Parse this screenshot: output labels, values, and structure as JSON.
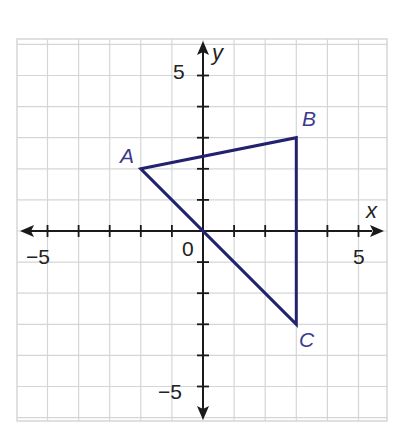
{
  "diagram": {
    "type": "coordinate-plane",
    "axes": {
      "x_label": "x",
      "y_label": "y",
      "origin_label": "0",
      "x_range": [
        -6,
        6
      ],
      "y_range": [
        -6,
        6
      ],
      "tick_labels": {
        "x_neg": "−5",
        "x_pos": "5",
        "y_pos": "5",
        "y_neg": "−5"
      }
    },
    "points": [
      {
        "name": "A",
        "x": -2,
        "y": 2
      },
      {
        "name": "B",
        "x": 3,
        "y": 3
      },
      {
        "name": "C",
        "x": 3,
        "y": -3
      }
    ],
    "polygon": [
      "A",
      "B",
      "C"
    ],
    "colors": {
      "grid": "#d3d6d9",
      "axis": "#1a1a1a",
      "triangle": "#22226e",
      "point_label": "#3b3b8c",
      "tick_label": "#222222"
    }
  }
}
